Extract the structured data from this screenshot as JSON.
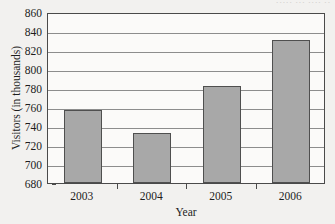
{
  "scan_header_fragment": "····· ··· ···· ··",
  "chart_data": {
    "type": "bar",
    "title": "",
    "xlabel": "Year",
    "ylabel": "Visitors (in thousands)",
    "categories": [
      "2003",
      "2004",
      "2005",
      "2006"
    ],
    "values": [
      757,
      733,
      782,
      831
    ],
    "ylim": [
      680,
      860
    ],
    "ytick_values": [
      680,
      700,
      720,
      740,
      760,
      780,
      800,
      820,
      840,
      860
    ],
    "ytick_labels": [
      "680",
      "700",
      "720",
      "740",
      "760",
      "780",
      "800",
      "820",
      "840",
      "860"
    ],
    "ytick_step": 20,
    "grid": true,
    "grid_axis": "y",
    "legend": false,
    "legend_position": "none",
    "bar_color": "#a8a8a8",
    "bar_edge_color": "#4f4f4f",
    "axis_color": "#4a4a4a",
    "grid_color": "#8d8d8d",
    "plot_background": "#fbfaf9",
    "page_background": "#f2f1ef"
  }
}
